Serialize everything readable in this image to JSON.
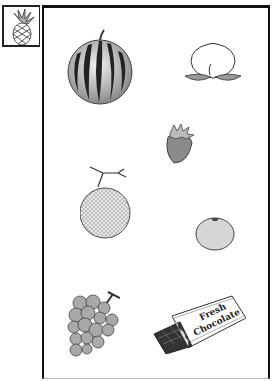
{
  "page": {
    "corner_item": {
      "name": "pineapple",
      "icon": "pineapple-icon"
    },
    "items": [
      {
        "name": "watermelon",
        "icon": "watermelon-icon"
      },
      {
        "name": "peach",
        "icon": "peach-icon"
      },
      {
        "name": "strawberry",
        "icon": "strawberry-icon"
      },
      {
        "name": "melon",
        "icon": "melon-icon"
      },
      {
        "name": "orange",
        "icon": "orange-icon"
      },
      {
        "name": "grapes",
        "icon": "grapes-icon"
      },
      {
        "name": "chocolate bar",
        "icon": "chocolate-icon"
      }
    ],
    "chocolate_label": {
      "line1": "Fresh",
      "line2": "Chocolate"
    }
  },
  "colors": {
    "line": "#222222",
    "light_gray": "#c8c8c8",
    "mid_gray": "#9a9a9a",
    "dark": "#333333",
    "paper": "#ffffff"
  }
}
